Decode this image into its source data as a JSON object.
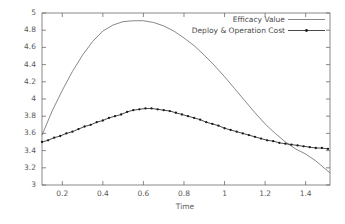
{
  "chart_data": {
    "type": "line",
    "title": "",
    "subtitle": "",
    "xlabel": "Time",
    "ylabel": "",
    "xlim": [
      0.1,
      1.52
    ],
    "ylim": [
      3,
      5
    ],
    "grid": false,
    "legend_position": "top-right",
    "x_ticks": [
      "0.2",
      "0.4",
      "0.6",
      "0.8",
      "1",
      "1.2",
      "1.4"
    ],
    "x_tick_values": [
      0.2,
      0.4,
      0.6,
      0.8,
      1.0,
      1.2,
      1.4
    ],
    "y_ticks": [
      "3",
      "3.2",
      "3.4",
      "3.6",
      "3.8",
      "4",
      "4.2",
      "4.4",
      "4.6",
      "4.8",
      "5"
    ],
    "y_tick_values": [
      3,
      3.2,
      3.4,
      3.6,
      3.8,
      4,
      4.2,
      4.4,
      4.6,
      4.8,
      5
    ],
    "series": [
      {
        "name": "Efficacy Value",
        "color": "#555555",
        "marker": "none",
        "x": [
          0.1,
          0.15,
          0.2,
          0.25,
          0.3,
          0.35,
          0.4,
          0.45,
          0.5,
          0.55,
          0.6,
          0.65,
          0.7,
          0.75,
          0.8,
          0.85,
          0.9,
          0.95,
          1.0,
          1.05,
          1.1,
          1.15,
          1.2,
          1.25,
          1.3,
          1.35,
          1.4,
          1.45,
          1.5,
          1.52
        ],
        "values": [
          3.58,
          3.86,
          4.1,
          4.32,
          4.51,
          4.67,
          4.79,
          4.86,
          4.9,
          4.91,
          4.91,
          4.89,
          4.85,
          4.79,
          4.71,
          4.62,
          4.51,
          4.39,
          4.26,
          4.12,
          3.98,
          3.84,
          3.71,
          3.6,
          3.5,
          3.42,
          3.36,
          3.28,
          3.18,
          3.14
        ]
      },
      {
        "name": "Deploy & Operation Cost",
        "color": "#1a1a1a",
        "marker": "point",
        "x": [
          0.1,
          0.13,
          0.16,
          0.19,
          0.22,
          0.25,
          0.28,
          0.31,
          0.34,
          0.37,
          0.4,
          0.43,
          0.46,
          0.49,
          0.52,
          0.55,
          0.58,
          0.61,
          0.64,
          0.67,
          0.7,
          0.73,
          0.76,
          0.79,
          0.82,
          0.85,
          0.88,
          0.91,
          0.94,
          0.97,
          1.0,
          1.03,
          1.06,
          1.09,
          1.12,
          1.15,
          1.18,
          1.21,
          1.24,
          1.27,
          1.3,
          1.33,
          1.36,
          1.39,
          1.42,
          1.45,
          1.48,
          1.51
        ],
        "values": [
          3.5,
          3.52,
          3.55,
          3.57,
          3.6,
          3.62,
          3.65,
          3.68,
          3.7,
          3.73,
          3.75,
          3.78,
          3.8,
          3.82,
          3.85,
          3.87,
          3.88,
          3.89,
          3.89,
          3.88,
          3.87,
          3.86,
          3.84,
          3.82,
          3.8,
          3.78,
          3.76,
          3.73,
          3.71,
          3.69,
          3.66,
          3.64,
          3.62,
          3.6,
          3.58,
          3.56,
          3.54,
          3.52,
          3.51,
          3.49,
          3.48,
          3.47,
          3.46,
          3.45,
          3.44,
          3.43,
          3.43,
          3.42
        ]
      }
    ]
  },
  "legend": {
    "entries": [
      {
        "label": "Efficacy Value"
      },
      {
        "label": "Deploy & Operation Cost"
      }
    ]
  },
  "axes": {
    "x_title": "Time"
  },
  "colors": {
    "frame": "#6b6b6b",
    "efficacy": "#555555",
    "cost": "#1a1a1a",
    "tick_text": "#5a5a5a",
    "background": "#ffffff"
  }
}
